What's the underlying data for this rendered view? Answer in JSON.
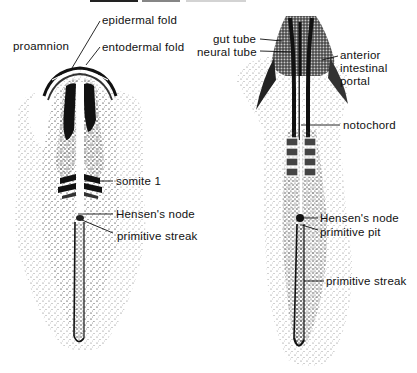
{
  "figure": {
    "type": "anatomical illustration",
    "colors": {
      "ink": "#111111",
      "stipple": "#555555",
      "background": "#ffffff"
    }
  },
  "left_embryo": {
    "labels": [
      {
        "id": "epidermal-fold",
        "text": "epidermal fold"
      },
      {
        "id": "proamnion",
        "text": "proamnion"
      },
      {
        "id": "entodermal-fold",
        "text": "entodermal fold"
      },
      {
        "id": "somite-1",
        "text": "somite 1"
      },
      {
        "id": "hensens-node",
        "text": "Hensen's node"
      },
      {
        "id": "primitive-streak",
        "text": "primitive streak"
      }
    ]
  },
  "right_embryo": {
    "labels": [
      {
        "id": "gut-tube",
        "text": "gut tube"
      },
      {
        "id": "neural-tube",
        "text": "neural tube"
      },
      {
        "id": "anterior-intestinal-portal",
        "text": "anterior\nintestinal\nportal"
      },
      {
        "id": "notochord",
        "text": "notochord"
      },
      {
        "id": "hensens-node",
        "text": "Hensen's node"
      },
      {
        "id": "primitive-pit",
        "text": "primitive pit"
      },
      {
        "id": "primitive-streak",
        "text": "primitive streak"
      }
    ]
  }
}
